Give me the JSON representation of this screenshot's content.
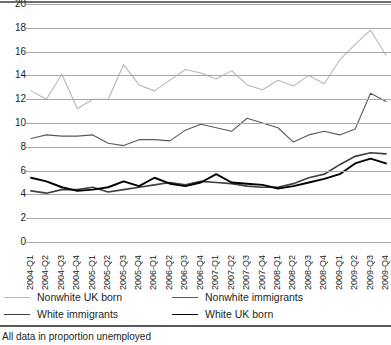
{
  "chart_data": {
    "type": "line",
    "title": "",
    "xlabel": "",
    "ylabel": "",
    "ylim": [
      0,
      20
    ],
    "yticks": [
      0,
      2,
      4,
      6,
      8,
      10,
      12,
      14,
      16,
      18,
      20
    ],
    "grid": true,
    "legend_position": "bottom",
    "footnote": "All data in proportion unemployed",
    "categories": [
      "2004-Q1",
      "2004-Q2",
      "2004-Q3",
      "2004-Q4",
      "2005-Q1",
      "2005-Q2",
      "2005-Q3",
      "2005-Q4",
      "2006-Q1",
      "2006-Q2",
      "2006-Q3",
      "2006-Q4",
      "2007-Q1",
      "2007-Q2",
      "2007-Q3",
      "2007-Q4",
      "2008-Q1",
      "2008-Q2",
      "2008-Q3",
      "2008-Q4",
      "2009-Q1",
      "2009-Q2",
      "2009-Q3",
      "2009-Q4"
    ],
    "series": [
      {
        "name": "Nonwhite UK born",
        "color": "#b5b7b9",
        "width": 1.1,
        "values": [
          12.7,
          12.0,
          14.1,
          11.2,
          12.0,
          12.0,
          14.9,
          13.2,
          12.7,
          13.6,
          14.5,
          14.2,
          13.7,
          14.4,
          13.2,
          12.8,
          13.6,
          13.1,
          14.0,
          13.3,
          15.3,
          16.6,
          17.8,
          15.7
        ]
      },
      {
        "name": "Nonwhite immigrants",
        "color": "#58595b",
        "width": 1.1,
        "values": [
          8.7,
          9.0,
          8.9,
          8.9,
          9.0,
          8.3,
          8.1,
          8.6,
          8.6,
          8.5,
          9.4,
          9.9,
          9.6,
          9.3,
          10.4,
          10.0,
          9.6,
          8.4,
          9.0,
          9.3,
          9.0,
          9.5,
          12.5,
          11.8
        ]
      },
      {
        "name": "White immigrants",
        "color": "#404041",
        "width": 1.7,
        "values": [
          4.3,
          4.1,
          4.4,
          4.4,
          4.6,
          4.2,
          4.4,
          4.6,
          4.8,
          5.0,
          4.8,
          5.1,
          5.0,
          4.9,
          4.7,
          4.6,
          4.6,
          4.9,
          5.4,
          5.7,
          6.5,
          7.2,
          7.5,
          7.4
        ]
      },
      {
        "name": "White UK born",
        "color": "#000000",
        "width": 1.9,
        "values": [
          5.4,
          5.1,
          4.6,
          4.3,
          4.4,
          4.6,
          5.1,
          4.7,
          5.4,
          4.9,
          4.7,
          5.0,
          5.7,
          5.0,
          4.9,
          4.8,
          4.5,
          4.7,
          5.0,
          5.3,
          5.7,
          6.6,
          7.0,
          6.6
        ]
      }
    ]
  },
  "legend": {
    "items": [
      {
        "label": "Nonwhite UK born",
        "color": "#b5b7b9",
        "width": 1.1
      },
      {
        "label": "Nonwhite immigrants",
        "color": "#58595b",
        "width": 1.1
      },
      {
        "label": "White immigrants",
        "color": "#404041",
        "width": 1.7
      },
      {
        "label": "White UK born",
        "color": "#000000",
        "width": 1.9
      }
    ]
  }
}
